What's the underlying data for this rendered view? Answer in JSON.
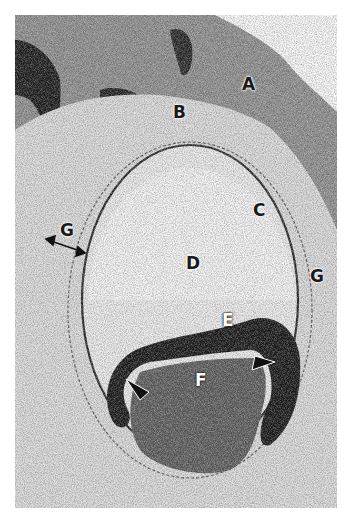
{
  "figure": {
    "type": "histology-micrograph",
    "colormode": "grayscale",
    "labels": [
      {
        "id": "A",
        "text": "A",
        "x": 242,
        "y": 83
      },
      {
        "id": "B",
        "text": "B",
        "x": 173,
        "y": 105
      },
      {
        "id": "C",
        "text": "C",
        "x": 253,
        "y": 200
      },
      {
        "id": "D",
        "text": "D",
        "x": 188,
        "y": 253
      },
      {
        "id": "E",
        "text": "E",
        "x": 222,
        "y": 316
      },
      {
        "id": "F",
        "text": "F",
        "x": 195,
        "y": 370
      },
      {
        "id": "G-right",
        "text": "G",
        "x": 310,
        "y": 270
      },
      {
        "id": "G-left",
        "text": "G",
        "x": 60,
        "y": 225
      }
    ],
    "annotations": {
      "double_arrow": "G-left width indicator",
      "arrowheads": 2
    },
    "colors": {
      "background": "#ffffff",
      "tissue_light": "#e8e8e8",
      "tissue_mid": "#9a9a9a",
      "tissue_dark": "#1e1e1e"
    }
  }
}
